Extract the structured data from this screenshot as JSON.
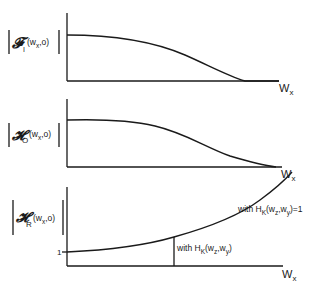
{
  "panels": [
    {
      "id": "transfer-function",
      "ylabel": {
        "symbol": "𝓕",
        "sub": "I",
        "args": "(w",
        "argsub": "x",
        "argtail": ",o)"
      },
      "xlabel": {
        "text": "W",
        "sub": "x"
      },
      "curve_shape": "decreasing to zero"
    },
    {
      "id": "object-spectrum",
      "ylabel": {
        "symbol": "𝓗",
        "sub": "O",
        "args": "(w",
        "argsub": "x",
        "argtail": ",o)"
      },
      "xlabel": {
        "text": "W",
        "sub": "x"
      },
      "curve_shape": "decreasing to zero"
    },
    {
      "id": "restoration-filter",
      "ylabel": {
        "symbol": "𝓗",
        "sub": "R",
        "args": "(w",
        "argsub": "x",
        "argtail": ",o)"
      },
      "xlabel": {
        "text": "W",
        "sub": "x"
      },
      "tick_label": "1",
      "curve_shape": "increasing from 1",
      "annotations": {
        "upper": {
          "pre": "with H",
          "sub": "K",
          "mid": "(w",
          "s1": "z",
          "c": ",w",
          "s2": "y",
          "post": ")=1"
        },
        "lower": {
          "pre": "with H",
          "sub": "K",
          "mid": "(w",
          "s1": "z",
          "c": ",w",
          "s2": "y",
          "post": ")"
        }
      }
    }
  ]
}
